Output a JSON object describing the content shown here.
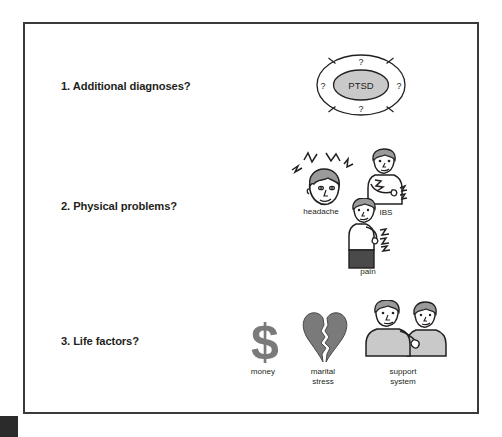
{
  "slide": {
    "background_color": "#ffffff",
    "border_color": "#3a3a3a",
    "corner_mark_color": "#2b2b2b"
  },
  "palette": {
    "ink": "#231f20",
    "gray_fill": "#7a7a7a",
    "light_gray_fill": "#c9c9c9",
    "skin_fill": "#ffffff",
    "hair_fill": "#9a9a9a",
    "dark_fill": "#4a4a4a"
  },
  "rows": [
    {
      "number": "1.",
      "label": "1. Additional diagnoses?"
    },
    {
      "number": "2.",
      "label": "2. Physical problems?"
    },
    {
      "number": "3.",
      "label": "3. Life factors?"
    }
  ],
  "ptsd_wheel": {
    "center_label": "PTSD",
    "segment_labels": [
      "?",
      "?",
      "?",
      "?"
    ],
    "segment_top": "?",
    "segment_right": "?",
    "segment_bottom": "?",
    "segment_left": "?",
    "center_fill": "#c9c9c9",
    "ring_fill": "#ffffff",
    "stroke": "#231f20"
  },
  "physical_icons": [
    {
      "name": "headache",
      "caption": "headache"
    },
    {
      "name": "ibs",
      "caption": "IBS"
    },
    {
      "name": "pain",
      "caption": "pain"
    }
  ],
  "life_icons": [
    {
      "name": "money",
      "caption": "money",
      "caption_line_1": "money",
      "caption_line_2": ""
    },
    {
      "name": "marital-stress",
      "caption": "marital stress",
      "caption_line_1": "marital",
      "caption_line_2": "stress"
    },
    {
      "name": "support-system",
      "caption": "support system",
      "caption_line_1": "support",
      "caption_line_2": "system"
    }
  ]
}
